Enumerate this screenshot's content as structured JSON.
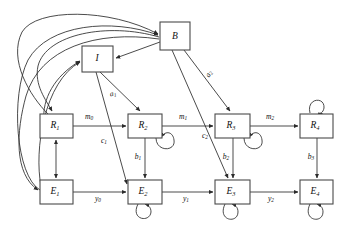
{
  "figure": {
    "kind": "directed-graph-diagram",
    "background_color": "#ffffff",
    "box_stroke_color": "#4a4a4a",
    "edge_stroke_color": "#2b2b2b",
    "text_color": "#111111",
    "width": 353,
    "height": 236
  },
  "nodes": [
    {
      "id": "B",
      "base": "B",
      "sub": "",
      "x": 160,
      "y": 22,
      "w": 30,
      "h": 28,
      "self_loop": "none"
    },
    {
      "id": "I",
      "base": "I",
      "sub": "",
      "x": 82,
      "y": 46,
      "w": 31,
      "h": 26,
      "self_loop": "none"
    },
    {
      "id": "R1",
      "base": "R",
      "sub": "1",
      "x": 40,
      "y": 114,
      "w": 33,
      "h": 24,
      "self_loop": "none"
    },
    {
      "id": "R2",
      "base": "R",
      "sub": "2",
      "x": 128,
      "y": 114,
      "w": 34,
      "h": 24,
      "self_loop": "bottom-right"
    },
    {
      "id": "R3",
      "base": "R",
      "sub": "3",
      "x": 215,
      "y": 114,
      "w": 35,
      "h": 24,
      "self_loop": "bottom-right"
    },
    {
      "id": "R4",
      "base": "R",
      "sub": "4",
      "x": 300,
      "y": 114,
      "w": 33,
      "h": 24,
      "self_loop": "top"
    },
    {
      "id": "E1",
      "base": "E",
      "sub": "1",
      "x": 40,
      "y": 180,
      "w": 33,
      "h": 24,
      "self_loop": "none"
    },
    {
      "id": "E2",
      "base": "E",
      "sub": "2",
      "x": 128,
      "y": 180,
      "w": 34,
      "h": 24,
      "self_loop": "bottom-left"
    },
    {
      "id": "E3",
      "base": "E",
      "sub": "3",
      "x": 215,
      "y": 180,
      "w": 35,
      "h": 24,
      "self_loop": "bottom"
    },
    {
      "id": "E4",
      "base": "E",
      "sub": "4",
      "x": 300,
      "y": 180,
      "w": 33,
      "h": 24,
      "self_loop": "bottom"
    }
  ],
  "edges": [
    {
      "id": "R1-R2",
      "from": "R1",
      "to": "R2",
      "label_base": "m",
      "label_sub": "0",
      "label_x": 89,
      "label_y": 117
    },
    {
      "id": "R2-R3",
      "from": "R2",
      "to": "R3",
      "label_base": "m",
      "label_sub": "1",
      "label_x": 183,
      "label_y": 117
    },
    {
      "id": "R3-R4",
      "from": "R3",
      "to": "R4",
      "label_base": "m",
      "label_sub": "2",
      "label_x": 270,
      "label_y": 117
    },
    {
      "id": "E1-E2",
      "from": "E1",
      "to": "E2",
      "label_base": "y",
      "label_sub": "0",
      "label_x": 98,
      "label_y": 199
    },
    {
      "id": "E2-E3",
      "from": "E2",
      "to": "E3",
      "label_base": "y",
      "label_sub": "1",
      "label_x": 186,
      "label_y": 199
    },
    {
      "id": "E3-E4",
      "from": "E3",
      "to": "E4",
      "label_base": "y",
      "label_sub": "2",
      "label_x": 271,
      "label_y": 199
    },
    {
      "id": "R2-E2",
      "from": "R2",
      "to": "E2",
      "label_base": "b",
      "label_sub": "1",
      "label_x": 138,
      "label_y": 158
    },
    {
      "id": "R3-E3",
      "from": "R3",
      "to": "E3",
      "label_base": "b",
      "label_sub": "2",
      "label_x": 226,
      "label_y": 158
    },
    {
      "id": "R4-E4",
      "from": "R4",
      "to": "E4",
      "label_base": "b",
      "label_sub": "3",
      "label_x": 311,
      "label_y": 158
    },
    {
      "id": "I-R2",
      "from": "I",
      "to": "R2",
      "label_base": "a",
      "label_sub": "1",
      "label_x": 113,
      "label_y": 94
    },
    {
      "id": "B-R3",
      "from": "B",
      "to": "R3",
      "label_base": "a",
      "label_sub": "2",
      "label_x": 208,
      "label_y": 74
    },
    {
      "id": "I-E2",
      "from": "I",
      "to": "E2",
      "label_base": "c",
      "label_sub": "1",
      "label_x": 104,
      "label_y": 141
    },
    {
      "id": "B-E3",
      "from": "B",
      "to": "E3",
      "label_base": "c",
      "label_sub": "2",
      "label_x": 205,
      "label_y": 136
    },
    {
      "id": "R1-E1",
      "from": "R1",
      "to": "E1",
      "label_base": "",
      "label_sub": "",
      "label_x": 0,
      "label_y": 0
    },
    {
      "id": "B-I",
      "from": "B",
      "to": "I",
      "label_base": "",
      "label_sub": "",
      "label_x": 0,
      "label_y": 0
    },
    {
      "id": "B-R1-curve",
      "from": "B",
      "to": "R1",
      "label_base": "",
      "label_sub": "",
      "label_x": 0,
      "label_y": 0
    },
    {
      "id": "B-E1-curve",
      "from": "B",
      "to": "E1",
      "label_base": "",
      "label_sub": "",
      "label_x": 0,
      "label_y": 0
    },
    {
      "id": "R1-I-curve",
      "from": "R1",
      "to": "I",
      "label_base": "",
      "label_sub": "",
      "label_x": 0,
      "label_y": 0
    },
    {
      "id": "E1-I-curve",
      "from": "E1",
      "to": "I",
      "label_base": "",
      "label_sub": "",
      "label_x": 0,
      "label_y": 0
    }
  ],
  "self_loops": [
    {
      "node": "R2",
      "position": "bottom-right"
    },
    {
      "node": "R3",
      "position": "bottom-right"
    },
    {
      "node": "R4",
      "position": "top"
    },
    {
      "node": "E2",
      "position": "bottom-left"
    },
    {
      "node": "E3",
      "position": "bottom"
    },
    {
      "node": "E4",
      "position": "bottom"
    }
  ]
}
